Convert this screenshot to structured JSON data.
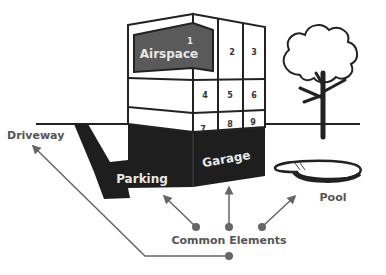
{
  "diagram": {
    "building": {
      "airspace_label": "Airspace",
      "units": [
        "1",
        "2",
        "3",
        "4",
        "5",
        "6",
        "7",
        "8",
        "9"
      ]
    },
    "base": {
      "parking_label": "Parking",
      "garage_label": "Garage"
    },
    "labels": {
      "driveway": "Driveway",
      "pool": "Pool",
      "common_elements": "Common Elements"
    },
    "colors": {
      "airspace_fill": "#5a5a5a",
      "base_fill": "#1e1e1e",
      "line": "#222222",
      "arrow": "#666666",
      "label_text": "#555555"
    }
  }
}
